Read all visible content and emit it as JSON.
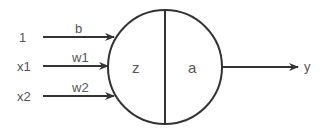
{
  "diagram": {
    "inputs": [
      {
        "label": "1",
        "weight": "b"
      },
      {
        "label": "x1",
        "weight": "w1"
      },
      {
        "label": "x2",
        "weight": "w2"
      }
    ],
    "neuron": {
      "left_label": "z",
      "right_label": "a"
    },
    "output": {
      "label": "y"
    },
    "colors": {
      "stroke": "#333333",
      "text": "#555555"
    }
  }
}
